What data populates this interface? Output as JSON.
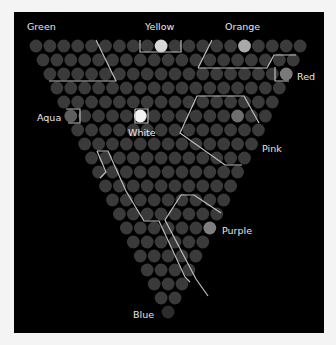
{
  "diagram": {
    "rows": 20,
    "top_row_count": 20,
    "origin": {
      "x": 36,
      "y": 46
    },
    "pitch_x": 13.9,
    "pitch_y": 14.0,
    "radius": 6.4,
    "colors": {
      "background": "#000000",
      "circle": "#3a3a3a",
      "highlight_bright": "#d8d8d8",
      "highlight_mid": "#7c7c7c",
      "line": "#bdbdbd",
      "label": "#e6e6e6"
    },
    "highlights": [
      {
        "name": "Yellow",
        "row": 0,
        "col": 9,
        "shade": "#d6d6d6"
      },
      {
        "name": "Orange",
        "row": 0,
        "col": 15,
        "shade": "#a9a9a9"
      },
      {
        "name": "Red",
        "row": 2,
        "col": 17,
        "shade": "#7a7a7a"
      },
      {
        "name": "Aqua",
        "row": 5,
        "col": 0,
        "shade": "#5e5e5e"
      },
      {
        "name": "White",
        "row": 5,
        "col": 5,
        "shade": "#f2f2f2"
      },
      {
        "name": "Pink",
        "row": 5,
        "col": 12,
        "shade": "#6e6e6e"
      },
      {
        "name": "Purple",
        "row": 13,
        "col": 6,
        "shade": "#7e7e7e"
      },
      {
        "name": "Blue",
        "row": 19,
        "col": 0,
        "shade": "#2c2c2c"
      }
    ],
    "labels": [
      {
        "text": "Green",
        "x": 27,
        "y": 21
      },
      {
        "text": "Yellow",
        "x": 145,
        "y": 21
      },
      {
        "text": "Orange",
        "x": 225,
        "y": 21
      },
      {
        "text": "Red",
        "x": 297,
        "y": 71
      },
      {
        "text": "Aqua",
        "x": 37,
        "y": 112
      },
      {
        "text": "White",
        "x": 128,
        "y": 127
      },
      {
        "text": "Pink",
        "x": 262,
        "y": 143
      },
      {
        "text": "Purple",
        "x": 222,
        "y": 225
      },
      {
        "text": "Blue",
        "x": 133,
        "y": 309
      }
    ],
    "lines": [
      [
        [
          96,
          40
        ],
        [
          116,
          81
        ],
        [
          49,
          81
        ]
      ],
      [
        [
          140,
          40
        ],
        [
          140,
          52
        ],
        [
          181,
          52
        ],
        [
          181,
          40
        ]
      ],
      [
        [
          212,
          40
        ],
        [
          198,
          68
        ]
      ],
      [
        [
          198,
          68
        ],
        [
          267,
          68
        ],
        [
          274,
          55
        ],
        [
          296,
          55
        ]
      ],
      [
        [
          275,
          67
        ],
        [
          275,
          81
        ],
        [
          289,
          81
        ]
      ],
      [
        [
          66,
          109
        ],
        [
          80,
          109
        ],
        [
          80,
          123
        ],
        [
          68,
          123
        ]
      ],
      [
        [
          135,
          109
        ],
        [
          148,
          109
        ],
        [
          148,
          123
        ],
        [
          135,
          123
        ],
        [
          135,
          109
        ]
      ],
      [
        [
          259,
          123
        ],
        [
          244,
          96
        ],
        [
          197,
          96
        ],
        [
          180,
          133
        ],
        [
          225,
          165
        ],
        [
          242,
          165
        ]
      ],
      [
        [
          97,
          151
        ],
        [
          108,
          151
        ],
        [
          126,
          191
        ],
        [
          144,
          221
        ],
        [
          159,
          221
        ],
        [
          185,
          277
        ],
        [
          190,
          282
        ]
      ],
      [
        [
          97,
          151
        ],
        [
          106,
          172
        ],
        [
          100,
          178
        ]
      ],
      [
        [
          181,
          195
        ],
        [
          165,
          220
        ],
        [
          196,
          279
        ],
        [
          208,
          296
        ]
      ],
      [
        [
          181,
          195
        ],
        [
          194,
          195
        ],
        [
          221,
          213
        ]
      ]
    ]
  }
}
